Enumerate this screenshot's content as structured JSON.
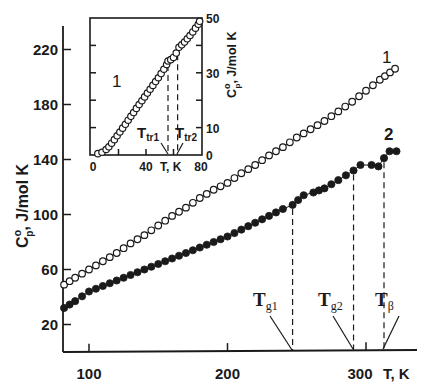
{
  "chart_data": [
    {
      "id": "main",
      "type": "scatter",
      "title": "",
      "xlabel": "T, K",
      "ylabel": "C°p, J/mol K",
      "xlim": [
        81,
        336
      ],
      "ylim": [
        0,
        240
      ],
      "xticks": [
        100,
        200,
        300
      ],
      "xtick_labels": [
        "100",
        "200",
        "300"
      ],
      "yticks": [
        20,
        60,
        100,
        140,
        180,
        220
      ],
      "ytick_labels": [
        "20",
        "60",
        "100",
        "140",
        "180",
        "220"
      ],
      "grid": false,
      "legend": "inline curve labels",
      "series": [
        {
          "name": "1",
          "marker": "open-circle",
          "x": [
            82,
            90,
            100,
            110,
            120,
            130,
            140,
            150,
            160,
            170,
            180,
            190,
            200,
            210,
            220,
            230,
            240,
            250,
            260,
            270,
            280,
            290,
            300,
            310,
            321
          ],
          "y": [
            49,
            54,
            60,
            66,
            72,
            79,
            85,
            92,
            99,
            105,
            112,
            118,
            123,
            130,
            136,
            143,
            149,
            156,
            162,
            168,
            175,
            182,
            190,
            198,
            206
          ]
        },
        {
          "name": "2",
          "marker": "filled-circle",
          "x": [
            82,
            90,
            100,
            110,
            120,
            130,
            140,
            150,
            160,
            170,
            180,
            190,
            200,
            210,
            220,
            230,
            240,
            247,
            255,
            262,
            270,
            280,
            291,
            296,
            304,
            309,
            313,
            317,
            322
          ],
          "y": [
            32,
            37,
            44,
            48,
            52,
            56,
            60,
            64,
            68,
            72,
            76,
            80,
            84,
            89,
            94,
            99,
            104,
            107,
            114,
            116,
            119,
            125,
            132,
            136,
            136,
            135,
            141,
            146,
            146
          ]
        }
      ],
      "annotations": [
        {
          "label": "Tg1",
          "main": "T",
          "sub": "g1",
          "x": 247
        },
        {
          "label": "Tg2",
          "main": "T",
          "sub": "g2",
          "x": 291
        },
        {
          "label": "Tβ",
          "main": "T",
          "sub": "β",
          "x": 313
        }
      ],
      "curve_labels": [
        {
          "text": "1",
          "series": "1"
        },
        {
          "text": "2",
          "series": "2"
        }
      ]
    },
    {
      "id": "inset",
      "type": "scatter",
      "title": "",
      "xlabel": "T, K",
      "ylabel": "C°p, J/mol K",
      "xlim": [
        0,
        80
      ],
      "ylim": [
        0,
        50
      ],
      "xticks": [
        0,
        20,
        40,
        60,
        80
      ],
      "xtick_labels": [
        "0",
        "",
        "40",
        "",
        "80"
      ],
      "yticks": [
        0,
        10,
        20,
        30,
        40,
        50
      ],
      "ytick_labels": [
        "0",
        "10",
        "",
        "30",
        "",
        "50"
      ],
      "yaxis_position": "right",
      "grid": false,
      "series": [
        {
          "name": "1",
          "marker": "open-circle",
          "x": [
            5,
            8,
            11,
            13,
            15,
            17,
            19,
            21,
            23,
            25,
            27,
            29,
            31,
            33,
            35,
            37,
            39,
            41,
            43,
            45,
            47,
            49,
            51,
            53,
            55,
            56,
            58,
            60,
            62,
            64,
            66,
            68,
            70,
            72,
            74,
            76,
            78,
            79
          ],
          "y": [
            0.5,
            1,
            2,
            3,
            4.3,
            5.6,
            7,
            8.4,
            9.8,
            11.2,
            12.7,
            14.1,
            15.5,
            17,
            18.4,
            19.8,
            21.2,
            22.6,
            24,
            25.4,
            26.8,
            28.2,
            29.7,
            31.3,
            33,
            34.3,
            34.8,
            35.6,
            37.2,
            39.3,
            40.2,
            41.2,
            42.4,
            43.6,
            44.9,
            46.3,
            47.7,
            48.8
          ]
        }
      ],
      "annotations": [
        {
          "label": "Ttr1",
          "main": "T",
          "sub": "tr1",
          "x": 56
        },
        {
          "label": "Ttr2",
          "main": "T",
          "sub": "tr2",
          "x": 63
        }
      ],
      "curve_labels": [
        {
          "text": "1",
          "series": "1"
        }
      ]
    }
  ]
}
